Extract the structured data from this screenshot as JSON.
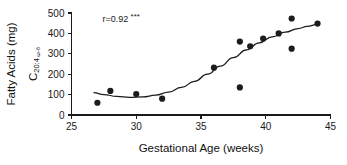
{
  "chart_data": {
    "type": "scatter",
    "title": "",
    "xlabel": "Gestational Age (weeks)",
    "ylabel": "Fatty Acids (mg)",
    "ylabel_subscript_prefix": "C",
    "ylabel_subscript_index": "20:4",
    "ylabel_subscript_omega": "ω-6",
    "xlim": [
      25,
      45
    ],
    "ylim": [
      0,
      500
    ],
    "xticks": [
      25,
      30,
      35,
      40,
      45
    ],
    "yticks": [
      0,
      100,
      200,
      300,
      400,
      500
    ],
    "xtick_labels": [
      "25",
      "30",
      "35",
      "40",
      "45"
    ],
    "ytick_labels": [
      "0",
      "100",
      "200",
      "300",
      "400",
      "500"
    ],
    "grid": false,
    "legend": "none",
    "annotations": [
      {
        "name": "correlation-annotation",
        "text": "r=0.92",
        "stars": "***",
        "x": 27.4,
        "y": 455
      }
    ],
    "series": [
      {
        "name": "Arachidonic acid C20:4 w-6 vs gestational age",
        "marker": "filled-circle",
        "marker_color": "#1c1c1c",
        "points": [
          {
            "x": 27.0,
            "y": 60
          },
          {
            "x": 28.0,
            "y": 118
          },
          {
            "x": 30.0,
            "y": 103
          },
          {
            "x": 32.0,
            "y": 80
          },
          {
            "x": 36.0,
            "y": 232
          },
          {
            "x": 38.0,
            "y": 360
          },
          {
            "x": 38.0,
            "y": 135
          },
          {
            "x": 38.8,
            "y": 337
          },
          {
            "x": 39.8,
            "y": 375
          },
          {
            "x": 41.0,
            "y": 400
          },
          {
            "x": 42.0,
            "y": 473
          },
          {
            "x": 42.0,
            "y": 325
          },
          {
            "x": 44.0,
            "y": 448
          }
        ]
      }
    ],
    "fit_curve": {
      "name": "cubic-trend-line",
      "color": "#1c1c1c",
      "points": [
        {
          "x": 26.7,
          "y": 110
        },
        {
          "x": 27.5,
          "y": 100
        },
        {
          "x": 28.5,
          "y": 91
        },
        {
          "x": 29.5,
          "y": 87
        },
        {
          "x": 30.5,
          "y": 89
        },
        {
          "x": 31.5,
          "y": 97
        },
        {
          "x": 32.5,
          "y": 112
        },
        {
          "x": 33.5,
          "y": 135
        },
        {
          "x": 34.5,
          "y": 165
        },
        {
          "x": 35.5,
          "y": 200
        },
        {
          "x": 36.5,
          "y": 240
        },
        {
          "x": 37.5,
          "y": 281
        },
        {
          "x": 38.5,
          "y": 319
        },
        {
          "x": 39.5,
          "y": 354
        },
        {
          "x": 40.5,
          "y": 383
        },
        {
          "x": 41.5,
          "y": 406
        },
        {
          "x": 42.5,
          "y": 424
        },
        {
          "x": 43.2,
          "y": 434
        },
        {
          "x": 44.0,
          "y": 444
        }
      ]
    }
  }
}
